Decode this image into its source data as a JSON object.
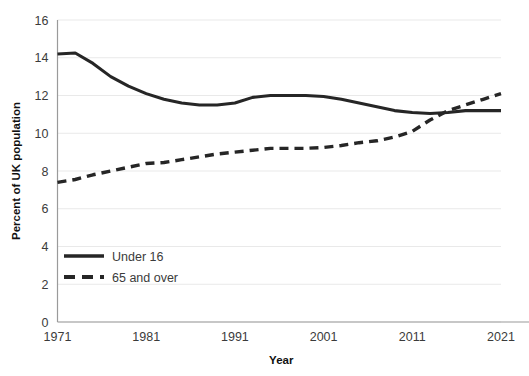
{
  "chart_data": {
    "type": "line",
    "title": "",
    "subtitle": "",
    "xlabel": "Year",
    "ylabel": "Percent of UK population",
    "xlim": [
      1971,
      2021
    ],
    "ylim": [
      0,
      16
    ],
    "ytick_step": 2,
    "grid": "horizontal",
    "legend_position": "inside-lower-left",
    "yticks": [
      "0",
      "2",
      "4",
      "6",
      "8",
      "10",
      "12",
      "14",
      "16"
    ],
    "xticks": [
      "1971",
      "1981",
      "1991",
      "2001",
      "2011",
      "2021"
    ],
    "x": [
      1971,
      1973,
      1975,
      1977,
      1979,
      1981,
      1983,
      1985,
      1987,
      1989,
      1991,
      1993,
      1995,
      1997,
      1999,
      2001,
      2003,
      2005,
      2007,
      2009,
      2011,
      2013,
      2015,
      2017,
      2019,
      2021
    ],
    "series": [
      {
        "name": "Under 16",
        "style": "solid",
        "color": "#262626",
        "values": [
          14.2,
          14.25,
          13.7,
          13.0,
          12.5,
          12.1,
          11.8,
          11.6,
          11.5,
          11.5,
          11.6,
          11.9,
          12.0,
          12.0,
          12.0,
          11.95,
          11.8,
          11.6,
          11.4,
          11.2,
          11.1,
          11.05,
          11.1,
          11.2,
          11.2,
          11.2
        ]
      },
      {
        "name": "65 and over",
        "style": "dashed",
        "color": "#262626",
        "values": [
          7.4,
          7.55,
          7.8,
          8.0,
          8.2,
          8.4,
          8.45,
          8.6,
          8.75,
          8.9,
          9.0,
          9.1,
          9.2,
          9.2,
          9.2,
          9.25,
          9.35,
          9.5,
          9.6,
          9.8,
          10.1,
          10.7,
          11.2,
          11.5,
          11.8,
          12.1
        ]
      }
    ],
    "legend": [
      {
        "label": "Under 16",
        "style": "solid"
      },
      {
        "label": "65 and over",
        "style": "dashed"
      }
    ],
    "colors": {
      "line": "#262626",
      "grid": "#e9e9e9",
      "axis": "#9a9a9a",
      "text": "#3b3b3b",
      "background": "#ffffff"
    }
  }
}
